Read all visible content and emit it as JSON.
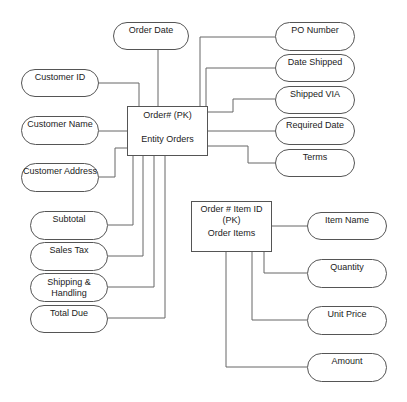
{
  "entities": {
    "orders": {
      "pk": "Order# (PK)",
      "name": "Entity Orders"
    },
    "order_items": {
      "pk": "Order # Item ID (PK)",
      "name": "Order Items"
    }
  },
  "attributes": {
    "order_date": "Order Date",
    "po_number": "PO Number",
    "date_shipped": "Date Shipped",
    "shipped_via": "Shipped VIA",
    "required_date": "Required Date",
    "terms": "Terms",
    "customer_id": "Customer ID",
    "customer_name": "Customer Name",
    "customer_address": "Customer Address",
    "subtotal": "Subtotal",
    "sales_tax": "Sales Tax",
    "shipping_handling": "Shipping & Handling",
    "total_due": "Total Due",
    "item_name": "Item Name",
    "quantity": "Quantity",
    "unit_price": "Unit Price",
    "amount": "Amount"
  }
}
